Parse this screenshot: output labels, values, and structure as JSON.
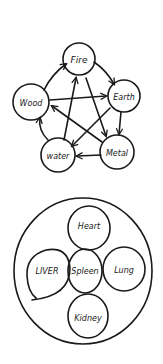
{
  "five_elements": {
    "nodes": [
      {
        "id": "fire",
        "label": "Fire"
      },
      {
        "id": "earth",
        "label": "Earth"
      },
      {
        "id": "metal",
        "label": "Metal"
      },
      {
        "id": "water",
        "label": "water"
      },
      {
        "id": "wood",
        "label": "Wood"
      }
    ],
    "generating_cycle": [
      "Wood→Fire",
      "Fire→Earth",
      "Earth→Metal",
      "Metal→Water",
      "Water→Wood"
    ],
    "controlling_cycle": [
      "Wood→Earth",
      "Earth→Water",
      "Water→Fire",
      "Fire→Metal",
      "Metal→Wood"
    ]
  },
  "organs": {
    "nodes": [
      {
        "id": "heart",
        "label": "Heart"
      },
      {
        "id": "liver",
        "label": "LIVER"
      },
      {
        "id": "spleen",
        "label": "Spleen"
      },
      {
        "id": "lung",
        "label": "Lung"
      },
      {
        "id": "kidney",
        "label": "Kidney"
      }
    ]
  },
  "colors": {
    "ink": "#1a1a1a",
    "background": "#ffffff"
  }
}
